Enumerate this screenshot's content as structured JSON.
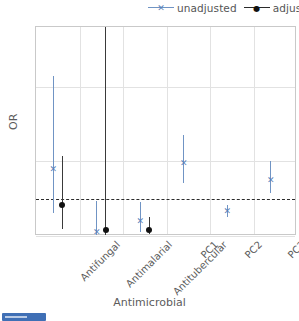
{
  "chart_data": {
    "type": "scatter",
    "title": "",
    "xlabel": "Antimicrobial",
    "ylabel": "OR",
    "categories": [
      "Antifungal",
      "Antimalarial",
      "Antitubercular",
      "PC1",
      "PC2",
      "PC3"
    ],
    "yticks": [
      0,
      2,
      4
    ],
    "ylim": [
      0,
      5.6
    ],
    "grid": true,
    "legend_position": "top-right",
    "reference_line": {
      "value": 1,
      "style": "dashed",
      "color": "#2b2b2b"
    },
    "series": [
      {
        "name": "unadjusted",
        "color": "#5a81b8",
        "marker": "x",
        "points": [
          {
            "category": "Antifungal",
            "value": 1.8,
            "ci_low": 0.62,
            "ci_high": 4.3
          },
          {
            "category": "Antimalarial",
            "value": 0.12,
            "ci_low": 0.02,
            "ci_high": 0.95
          },
          {
            "category": "Antitubercular",
            "value": 0.4,
            "ci_low": 0.12,
            "ci_high": 0.92
          },
          {
            "category": "PC1",
            "value": 1.95,
            "ci_low": 1.42,
            "ci_high": 2.7
          },
          {
            "category": "PC2",
            "value": 0.66,
            "ci_low": 0.52,
            "ci_high": 0.84
          },
          {
            "category": "PC3",
            "value": 1.5,
            "ci_low": 1.15,
            "ci_high": 2.02
          }
        ]
      },
      {
        "name": "adjusted",
        "color": "#111111",
        "marker": "o",
        "points": [
          {
            "category": "Antifungal",
            "value": 0.82,
            "ci_low": 0.2,
            "ci_high": 2.15
          },
          {
            "category": "Antimalarial",
            "value": 0.16,
            "ci_low": 0.02,
            "ci_high": 5.6
          },
          {
            "category": "Antitubercular",
            "value": 0.15,
            "ci_low": 0.04,
            "ci_high": 0.52
          },
          {
            "category": "PC1",
            "value": null,
            "ci_low": null,
            "ci_high": null
          },
          {
            "category": "PC2",
            "value": null,
            "ci_low": null,
            "ci_high": null
          },
          {
            "category": "PC3",
            "value": null,
            "ci_low": null,
            "ci_high": null
          }
        ]
      }
    ]
  },
  "legend": {
    "items": [
      {
        "label": "unadjusted",
        "marker": "✕",
        "color": "#5a81b8"
      },
      {
        "label": "adjusted",
        "marker": "●",
        "color": "#111111"
      }
    ]
  }
}
